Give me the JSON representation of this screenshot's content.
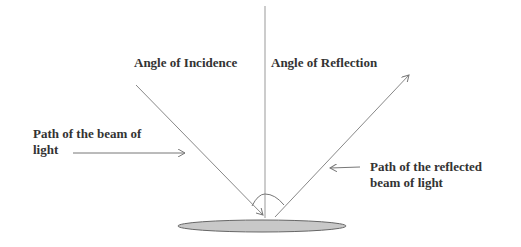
{
  "labels": {
    "angle_incidence": "Angle of Incidence",
    "angle_reflection": "Angle of Reflection",
    "incident_path_line1": "Path of the beam of",
    "incident_path_line2": "light",
    "reflected_path_line1": "Path of the reflected",
    "reflected_path_line2": "beam of light"
  },
  "colors": {
    "line": "#888888",
    "text": "#333333",
    "mirror_fill": "#c8c8c8",
    "mirror_stroke": "#666666"
  }
}
